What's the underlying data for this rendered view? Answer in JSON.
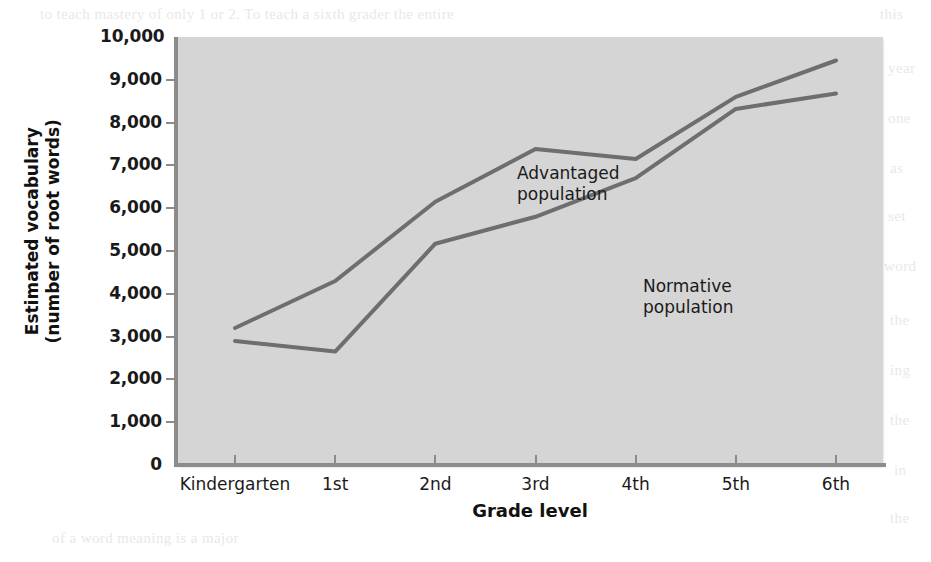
{
  "chart_data": {
    "type": "line",
    "title": "",
    "xlabel": "Grade level",
    "ylabel": "Estimated vocabulary (number of root words)",
    "ylabel_line1": "Estimated vocabulary",
    "ylabel_line2": "(number of root words)",
    "categories": [
      "Kindergarten",
      "1st",
      "2nd",
      "3rd",
      "4th",
      "5th",
      "6th"
    ],
    "ylim": [
      0,
      10000
    ],
    "ytick_values": [
      0,
      1000,
      2000,
      3000,
      4000,
      5000,
      6000,
      7000,
      8000,
      9000,
      10000
    ],
    "ytick_labels": [
      "0",
      "1,000",
      "2,000",
      "3,000",
      "4,000",
      "5,000",
      "6,000",
      "7,000",
      "8,000",
      "9,000",
      "10,000"
    ],
    "grid": false,
    "legend_position": "inline-annotations",
    "series": [
      {
        "name": "Advantaged population",
        "label_line1": "Advantaged",
        "label_line2": "population",
        "color": "#6e6e6e",
        "values": [
          3200,
          4300,
          6150,
          7380,
          7150,
          8600,
          9450
        ]
      },
      {
        "name": "Normative population",
        "label_line1": "Normative",
        "label_line2": "population",
        "color": "#6e6e6e",
        "values": [
          2900,
          2650,
          5170,
          5800,
          6700,
          8320,
          8680
        ]
      }
    ]
  },
  "figure": {
    "plot_background_color": "#d5d5d5",
    "page_background_color": "#ffffff",
    "axis_color": "#8c8c8c",
    "line_color": "#6e6e6e"
  },
  "ghost_text": [
    {
      "text": "to teach mastery of only 1 or 2. To teach a sixth grader the entire",
      "left": 40,
      "top": 6
    },
    {
      "text": "this",
      "left": 880,
      "top": 6
    },
    {
      "text": "year",
      "left": 888,
      "top": 60
    },
    {
      "text": "one",
      "left": 888,
      "top": 110
    },
    {
      "text": "as",
      "left": 890,
      "top": 160
    },
    {
      "text": "set",
      "left": 888,
      "top": 208
    },
    {
      "text": "word",
      "left": 884,
      "top": 258
    },
    {
      "text": "the",
      "left": 890,
      "top": 312
    },
    {
      "text": "ing",
      "left": 890,
      "top": 362
    },
    {
      "text": "the",
      "left": 890,
      "top": 412
    },
    {
      "text": "in",
      "left": 894,
      "top": 462
    },
    {
      "text": "the",
      "left": 890,
      "top": 510
    },
    {
      "text": "of a word meaning is a major",
      "left": 52,
      "top": 530
    }
  ]
}
